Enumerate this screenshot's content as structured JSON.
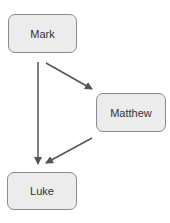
{
  "diagram": {
    "nodes": [
      {
        "id": "mark",
        "label": "Mark"
      },
      {
        "id": "matthew",
        "label": "Matthew"
      },
      {
        "id": "luke",
        "label": "Luke"
      }
    ],
    "edges": [
      {
        "from": "mark",
        "to": "matthew"
      },
      {
        "from": "mark",
        "to": "luke"
      },
      {
        "from": "matthew",
        "to": "luke"
      }
    ],
    "colors": {
      "node_fill": "#ececec",
      "node_border": "#8a8a8a",
      "arrow": "#555555"
    }
  }
}
